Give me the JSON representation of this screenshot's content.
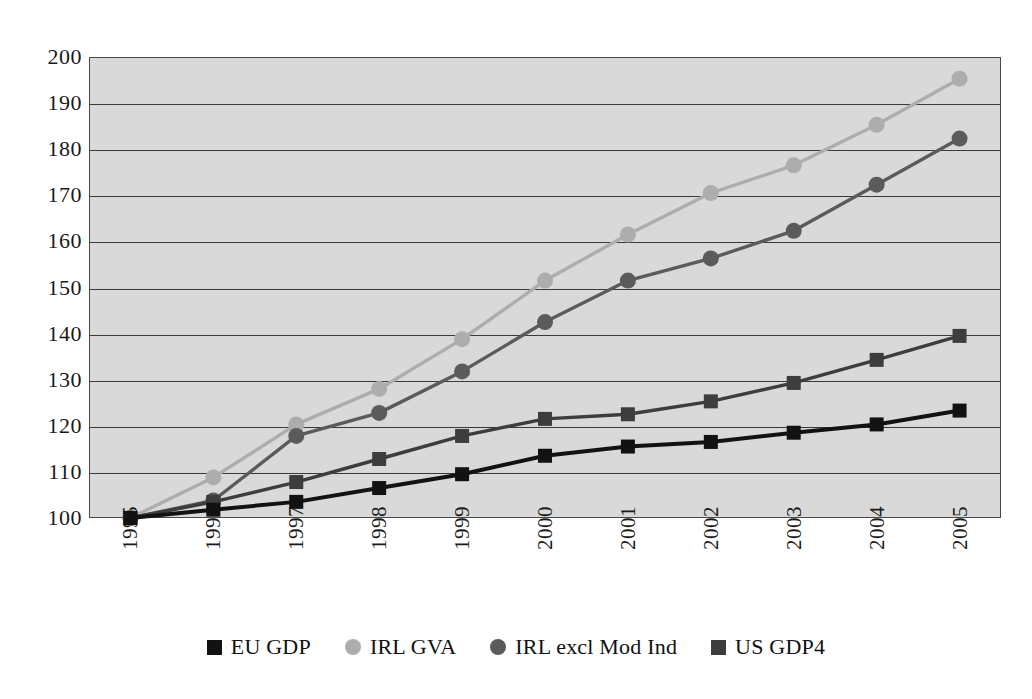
{
  "chart_data": {
    "type": "line",
    "title": "",
    "subtitle": "",
    "xlabel": "",
    "ylabel": "",
    "categories": [
      "1995",
      "1996",
      "1997",
      "1998",
      "1999",
      "2000",
      "2001",
      "2002",
      "2003",
      "2004",
      "2005"
    ],
    "ylim": [
      100,
      200
    ],
    "ytick_step": 10,
    "yticks": [
      "200",
      "190",
      "180",
      "170",
      "160",
      "150",
      "140",
      "130",
      "120",
      "110",
      "100"
    ],
    "grid": true,
    "legend_position": "bottom",
    "plot_background": "#d9d9d9",
    "series": [
      {
        "name": "EU GDP",
        "color": "#121212",
        "marker": "square",
        "values": [
          100.0,
          101.8,
          103.5,
          106.5,
          109.5,
          113.5,
          115.5,
          116.5,
          118.5,
          120.3,
          123.3
        ]
      },
      {
        "name": "IRL GVA",
        "color": "#adadad",
        "marker": "circle",
        "values": [
          100.0,
          108.8,
          120.3,
          128.0,
          138.8,
          151.5,
          161.5,
          170.5,
          176.5,
          185.3,
          195.3
        ]
      },
      {
        "name": "IRL excl Mod Ind",
        "color": "#5b5b5b",
        "marker": "circle",
        "values": [
          100.0,
          103.8,
          117.8,
          122.8,
          131.8,
          142.5,
          151.5,
          156.3,
          162.3,
          172.3,
          182.3
        ]
      },
      {
        "name": "US GDP4",
        "color": "#3d3d3d",
        "marker": "square",
        "values": [
          100.0,
          103.5,
          107.8,
          112.8,
          117.8,
          121.5,
          122.5,
          125.3,
          129.3,
          134.3,
          139.5
        ]
      }
    ]
  },
  "legend": {
    "items": [
      {
        "label": "EU GDP",
        "color": "#121212",
        "marker": "square"
      },
      {
        "label": "IRL GVA",
        "color": "#adadad",
        "marker": "circle"
      },
      {
        "label": "IRL excl Mod Ind",
        "color": "#5b5b5b",
        "marker": "circle"
      },
      {
        "label": "US GDP4",
        "color": "#3d3d3d",
        "marker": "square"
      }
    ]
  }
}
